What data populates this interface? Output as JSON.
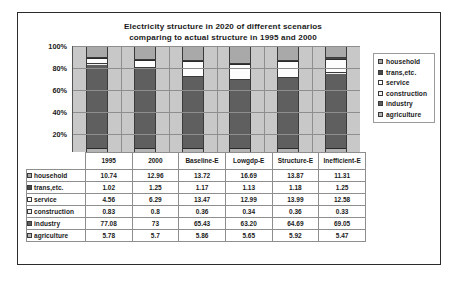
{
  "chart_data": {
    "type": "bar",
    "subtype": "stacked-percent",
    "title": "Electricity structure in 2020 of different scenarios comparing to actual structure in 1995 and 2000",
    "title_line1": "Electricity structure in 2020 of different scenarios",
    "title_line2": "comparing to actual structure in 1995 and 2000",
    "xlabel": "",
    "ylabel": "",
    "ylim": [
      0,
      100
    ],
    "ytick_labels": [
      "100%",
      "80%",
      "60%",
      "40%",
      "20%",
      "0%"
    ],
    "ytick_values": [
      100,
      80,
      60,
      40,
      20,
      0
    ],
    "grid": true,
    "legend_position": "right",
    "categories": [
      "1995",
      "2000",
      "Baseline-E",
      "Lowgdp-E",
      "Structure-E",
      "Inefficient-E"
    ],
    "series": [
      {
        "name": "household",
        "color": "#a9a9a9",
        "values": [
          10.74,
          12.96,
          13.72,
          16.69,
          13.87,
          11.31
        ]
      },
      {
        "name": "trans,etc.",
        "color": "#4a4a4a",
        "values": [
          1.02,
          1.25,
          1.17,
          1.13,
          1.18,
          1.25
        ]
      },
      {
        "name": "service",
        "color": "#fdfdfd",
        "values": [
          4.56,
          6.29,
          13.47,
          12.99,
          13.99,
          12.58
        ]
      },
      {
        "name": "construction",
        "color": "#f0f0f0",
        "values": [
          0.83,
          0.8,
          0.36,
          0.34,
          0.36,
          0.33
        ]
      },
      {
        "name": "industry",
        "color": "#5f5f5f",
        "values": [
          77.08,
          73,
          65.43,
          63.2,
          64.69,
          69.05
        ]
      },
      {
        "name": "agriculture",
        "color": "#b4b4b4",
        "values": [
          5.78,
          5.7,
          5.86,
          5.65,
          5.92,
          5.47
        ]
      }
    ],
    "plot_background": "#c8c8c8"
  },
  "legend": {
    "items": [
      {
        "label": "household"
      },
      {
        "label": "trans,etc."
      },
      {
        "label": "service"
      },
      {
        "label": "construction"
      },
      {
        "label": "industry"
      },
      {
        "label": "agriculture"
      }
    ]
  },
  "data_table": {
    "corner": "",
    "columns": [
      "1995",
      "2000",
      "Baseline-E",
      "Lowgdp-E",
      "Structure-E",
      "Inefficient-E"
    ],
    "rows": [
      {
        "label": "household",
        "cells": [
          "10.74",
          "12.96",
          "13.72",
          "16.69",
          "13.87",
          "11.31"
        ]
      },
      {
        "label": "trans,etc.",
        "cells": [
          "1.02",
          "1.25",
          "1.17",
          "1.13",
          "1.18",
          "1.25"
        ]
      },
      {
        "label": "service",
        "cells": [
          "4.56",
          "6.29",
          "13.47",
          "12.99",
          "13.99",
          "12.58"
        ]
      },
      {
        "label": "construction",
        "cells": [
          "0.83",
          "0.8",
          "0.36",
          "0.34",
          "0.36",
          "0.33"
        ]
      },
      {
        "label": "industry",
        "cells": [
          "77.08",
          "73",
          "65.43",
          "63.20",
          "64.69",
          "69.05"
        ]
      },
      {
        "label": "agriculture",
        "cells": [
          "5.78",
          "5.7",
          "5.86",
          "5.65",
          "5.92",
          "5.47"
        ]
      }
    ]
  }
}
